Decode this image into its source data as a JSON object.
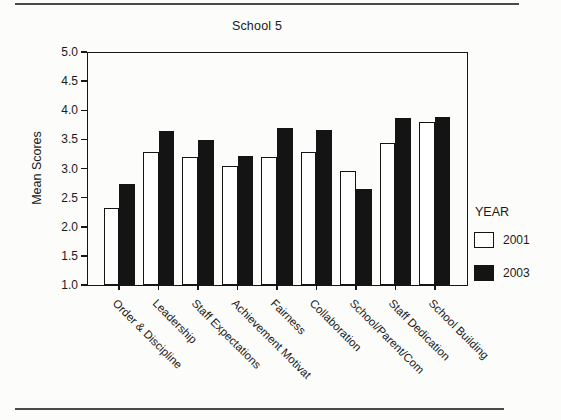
{
  "chart_data": {
    "type": "bar",
    "title": "School 5",
    "ylabel": "Mean Scores",
    "xlabel": "",
    "ylim": [
      1.0,
      5.0
    ],
    "ytick_labels": [
      "5.0",
      "4.5",
      "4.0",
      "3.5",
      "3.0",
      "2.5",
      "2.0",
      "1.5",
      "1.0"
    ],
    "grid": false,
    "legend_title": "YEAR",
    "legend_position": "right",
    "categories": [
      "Order & Discipline",
      "Leadership",
      "Staff Expectations",
      "Achievement Motivat",
      "Fairness",
      "Collaboration",
      "School/Parent/Com",
      "Staff Dedication",
      "School Building"
    ],
    "series": [
      {
        "name": "2001",
        "fill": "#ffffff",
        "values": [
          2.33,
          3.29,
          3.19,
          3.05,
          3.2,
          3.28,
          2.96,
          3.43,
          3.79
        ]
      },
      {
        "name": "2003",
        "fill": "#141414",
        "values": [
          2.73,
          3.65,
          3.49,
          3.21,
          3.7,
          3.66,
          2.64,
          3.86,
          3.88
        ]
      }
    ],
    "bar_outline_color": "#141414",
    "frame_color": "#161616"
  }
}
